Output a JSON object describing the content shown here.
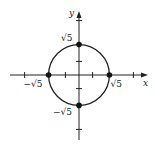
{
  "diagram": {
    "type": "graph-of-circle",
    "equation_hint": "x^2 + y^2 = 5",
    "axes": {
      "x_label": "x",
      "y_label": "y"
    },
    "radius": 2.236,
    "ticks": {
      "x": [
        -4,
        -1,
        1,
        4
      ],
      "y": [
        -4,
        -1,
        1,
        4
      ]
    },
    "points": [
      {
        "x": 0,
        "y": 2.236,
        "label": "√5"
      },
      {
        "x": 0,
        "y": -2.236,
        "label": "−√5"
      },
      {
        "x": 2.236,
        "y": 0,
        "label": "√5"
      },
      {
        "x": -2.236,
        "y": 0,
        "label": "−√5"
      }
    ],
    "colors": {
      "ink": "#222222"
    }
  }
}
